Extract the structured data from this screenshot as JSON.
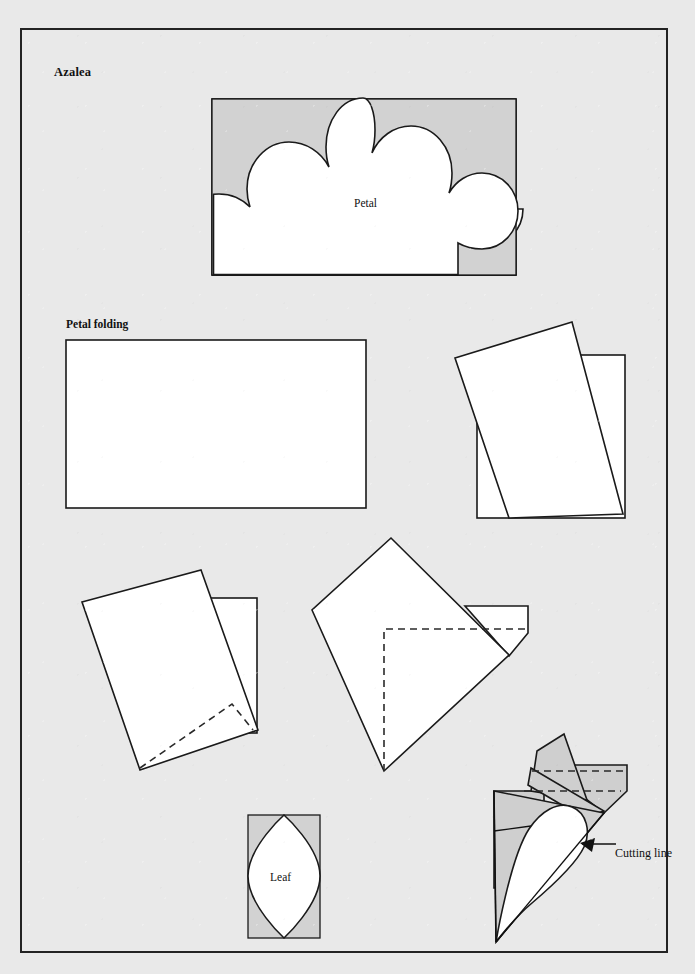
{
  "document": {
    "title": "Azalea",
    "page_background": "#e9e9e9",
    "frame_border_color": "#232323",
    "ink_color": "#1a1a1a",
    "shade_color": "#d2d2d2"
  },
  "labels": {
    "title": "Azalea",
    "petal_folding": "Petal folding",
    "petal": "Petal",
    "leaf": "Leaf",
    "cutting_line": "Cutting line"
  },
  "figures": [
    {
      "id": "petal-template",
      "name": "petal-template-figure",
      "label": "Petal",
      "description": "Five-lobed scalloped azalea petal template drawn white on a shaded rectangle",
      "box": {
        "x": 190,
        "y": 69,
        "width": 304,
        "height": 176
      },
      "lobes": 5
    },
    {
      "id": "fold-step-1",
      "name": "fold-step-1-figure",
      "label": "Petal folding",
      "description": "Plain rectangle of paper before folding",
      "box": {
        "x": 44,
        "y": 310,
        "width": 300,
        "height": 168
      }
    },
    {
      "id": "fold-step-2",
      "name": "fold-step-2-figure",
      "description": "Rectangle with a square rotated on top of it",
      "box": {
        "x": 433,
        "y": 292,
        "width": 172,
        "height": 198
      }
    },
    {
      "id": "fold-step-3",
      "name": "fold-step-3-figure",
      "description": "Rotated square with a dashed diagonal fold guide near the lower edge",
      "box": {
        "x": 60,
        "y": 542,
        "width": 190,
        "height": 206
      }
    },
    {
      "id": "fold-step-4",
      "name": "fold-step-4-figure",
      "description": "Diamond folded to a kite with dashed right-angle guide lines and a flap at right",
      "box": {
        "x": 288,
        "y": 505,
        "width": 226,
        "height": 240
      }
    },
    {
      "id": "leaf-template",
      "name": "leaf-template-figure",
      "label": "Leaf",
      "description": "Pointed oval leaf template drawn white on a shaded rectangle",
      "box": {
        "x": 226,
        "y": 785,
        "width": 72,
        "height": 123
      }
    },
    {
      "id": "cutting-line-figure",
      "name": "cutting-line-figure",
      "label": "Cutting line",
      "description": "Folded cone of shaded paper with a white teardrop cut shape, arrow labelled Cutting line",
      "box": {
        "x": 470,
        "y": 705,
        "width": 175,
        "height": 210
      },
      "annotation": {
        "text": "Cutting line",
        "arrow": "points up-left to the teardrop edge"
      }
    }
  ]
}
